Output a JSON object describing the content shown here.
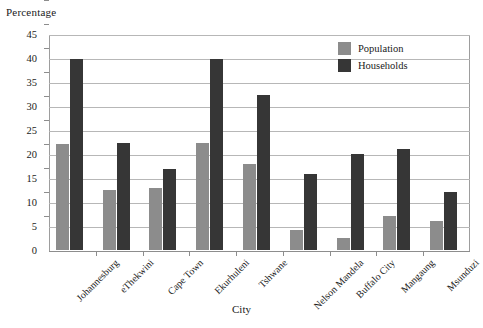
{
  "chart_data": {
    "type": "bar",
    "title": "",
    "ylabel": "Percentage",
    "xlabel": "City",
    "ylim": [
      0,
      45
    ],
    "ytick_step": 5,
    "yticks": [
      "0",
      "5",
      "10",
      "15",
      "20",
      "25",
      "30",
      "35",
      "40",
      "45"
    ],
    "grid": true,
    "legend_position": "top-right",
    "categories": [
      "Johannesburg",
      "eThekwini",
      "Cape Town",
      "Ekurhuleni",
      "Tshwane",
      "Nelson Mandela",
      "Buffalo City",
      "Mangaung",
      "Msunduzi"
    ],
    "series": [
      {
        "name": "Population",
        "color": "#8c8c8c",
        "values": [
          22.0,
          12.4,
          13.0,
          22.3,
          18.0,
          4.1,
          2.6,
          7.0,
          6.0
        ]
      },
      {
        "name": "Households",
        "color": "#363636",
        "values": [
          39.8,
          22.3,
          16.8,
          39.7,
          32.3,
          15.8,
          20.0,
          21.0,
          12.0
        ]
      }
    ]
  },
  "legend": {
    "items": [
      {
        "label": "Population",
        "color": "#8c8c8c"
      },
      {
        "label": "Households",
        "color": "#363636"
      }
    ]
  },
  "axes": {
    "y_axis_title": "Percentage",
    "x_axis_title": "City"
  }
}
